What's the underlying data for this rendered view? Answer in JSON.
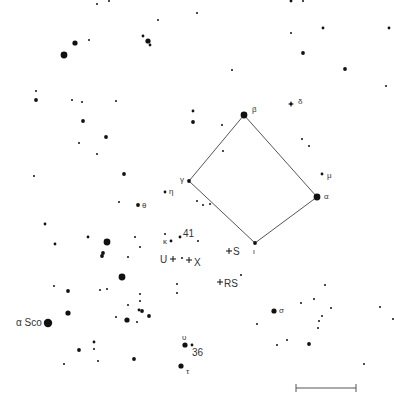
{
  "colors": {
    "background": "#ffffff",
    "star": "#111111",
    "line": "#555555",
    "label": "#333333"
  },
  "asterism": {
    "name": "Square",
    "vertices": [
      "beta",
      "alpha",
      "iota",
      "gamma"
    ],
    "note": "connecting lines beta–alpha–iota–gamma–beta"
  },
  "scale_bar": {
    "label": ""
  },
  "stars": [
    {
      "id": "beta",
      "x": 244,
      "y": 115,
      "mag": 2,
      "label": "β",
      "lx": 252,
      "ly": 112
    },
    {
      "id": "alpha",
      "x": 317,
      "y": 197,
      "mag": 2,
      "label": "α",
      "lx": 324,
      "ly": 199
    },
    {
      "id": "iota",
      "x": 255,
      "y": 243,
      "mag": 4,
      "label": "ι",
      "lx": 253,
      "ly": 254
    },
    {
      "id": "gamma",
      "x": 189,
      "y": 181,
      "mag": 4,
      "label": "γ",
      "lx": 180,
      "ly": 182
    },
    {
      "id": "delta",
      "x": 291,
      "y": 104,
      "mag": 5,
      "label": "δ",
      "lx": 298,
      "ly": 104,
      "cross": true
    },
    {
      "id": "mu",
      "x": 322,
      "y": 174,
      "mag": 5,
      "label": "μ",
      "lx": 327,
      "ly": 178
    },
    {
      "id": "eta",
      "x": 165,
      "y": 192,
      "mag": 5,
      "label": "η",
      "lx": 169,
      "ly": 194
    },
    {
      "id": "theta",
      "x": 138,
      "y": 205,
      "mag": 4,
      "label": "θ",
      "lx": 142,
      "ly": 208
    },
    {
      "id": "kappa",
      "x": 171,
      "y": 241,
      "mag": 5,
      "label": "κ",
      "lx": 163,
      "ly": 244
    },
    {
      "id": "41",
      "x": 180,
      "y": 237,
      "mag": 5,
      "label": "41",
      "lx": 183,
      "ly": 237
    },
    {
      "id": "sigma",
      "x": 274,
      "y": 311,
      "mag": 3,
      "label": "σ",
      "lx": 279,
      "ly": 313
    },
    {
      "id": "upsilon",
      "x": 185,
      "y": 345,
      "mag": 3,
      "label": "υ",
      "lx": 182,
      "ly": 340
    },
    {
      "id": "36",
      "x": 192,
      "y": 345,
      "mag": 5,
      "label": "36",
      "lx": 192,
      "ly": 356
    },
    {
      "id": "tau",
      "x": 181,
      "y": 366,
      "mag": 3,
      "label": "τ",
      "lx": 186,
      "ly": 374
    },
    {
      "id": "alphaSco",
      "x": 48,
      "y": 323,
      "mag": 1,
      "label": "α Sco",
      "lx": 16,
      "ly": 326
    },
    {
      "id": "s1",
      "x": 97,
      "y": 4,
      "mag": 6
    },
    {
      "id": "s2",
      "x": 109,
      "y": 1,
      "mag": 6
    },
    {
      "id": "s3",
      "x": 197,
      "y": 13,
      "mag": 6
    },
    {
      "id": "s4",
      "x": 158,
      "y": 20,
      "mag": 6
    },
    {
      "id": "s5",
      "x": 75,
      "y": 43,
      "mag": 3
    },
    {
      "id": "s6",
      "x": 89,
      "y": 40,
      "mag": 6
    },
    {
      "id": "s7",
      "x": 64,
      "y": 55,
      "mag": 2
    },
    {
      "id": "s8",
      "x": 143,
      "y": 36,
      "mag": 5
    },
    {
      "id": "s9",
      "x": 148,
      "y": 41,
      "mag": 3
    },
    {
      "id": "s10",
      "x": 150,
      "y": 45,
      "mag": 5
    },
    {
      "id": "s11",
      "x": 291,
      "y": 1,
      "mag": 5
    },
    {
      "id": "s12",
      "x": 303,
      "y": 1,
      "mag": 6
    },
    {
      "id": "s13",
      "x": 323,
      "y": 28,
      "mag": 5
    },
    {
      "id": "s14",
      "x": 389,
      "y": 28,
      "mag": 5
    },
    {
      "id": "s15",
      "x": 291,
      "y": 33,
      "mag": 6
    },
    {
      "id": "s16",
      "x": 303,
      "y": 53,
      "mag": 4
    },
    {
      "id": "s17",
      "x": 345,
      "y": 69,
      "mag": 4
    },
    {
      "id": "s18",
      "x": 386,
      "y": 86,
      "mag": 6
    },
    {
      "id": "s19",
      "x": 232,
      "y": 70,
      "mag": 6
    },
    {
      "id": "s20",
      "x": 36,
      "y": 91,
      "mag": 6
    },
    {
      "id": "s21",
      "x": 36,
      "y": 100,
      "mag": 4
    },
    {
      "id": "s22",
      "x": 72,
      "y": 100,
      "mag": 6
    },
    {
      "id": "s23",
      "x": 82,
      "y": 102,
      "mag": 6
    },
    {
      "id": "s24",
      "x": 116,
      "y": 101,
      "mag": 6
    },
    {
      "id": "s25",
      "x": 83,
      "y": 121,
      "mag": 4
    },
    {
      "id": "s26",
      "x": 106,
      "y": 137,
      "mag": 4
    },
    {
      "id": "s27",
      "x": 79,
      "y": 143,
      "mag": 6
    },
    {
      "id": "s28",
      "x": 97,
      "y": 154,
      "mag": 6
    },
    {
      "id": "s29",
      "x": 34,
      "y": 176,
      "mag": 6
    },
    {
      "id": "s30",
      "x": 124,
      "y": 174,
      "mag": 4
    },
    {
      "id": "s31",
      "x": 193,
      "y": 111,
      "mag": 5
    },
    {
      "id": "s32",
      "x": 193,
      "y": 122,
      "mag": 4
    },
    {
      "id": "s33",
      "x": 222,
      "y": 125,
      "mag": 6
    },
    {
      "id": "s34",
      "x": 223,
      "y": 151,
      "mag": 6
    },
    {
      "id": "s35",
      "x": 302,
      "y": 139,
      "mag": 6
    },
    {
      "id": "s36",
      "x": 309,
      "y": 146,
      "mag": 6
    },
    {
      "id": "s37",
      "x": 119,
      "y": 202,
      "mag": 6
    },
    {
      "id": "s38",
      "x": 197,
      "y": 201,
      "mag": 6
    },
    {
      "id": "s39",
      "x": 203,
      "y": 205,
      "mag": 6
    },
    {
      "id": "s40",
      "x": 210,
      "y": 204,
      "mag": 6
    },
    {
      "id": "s41",
      "x": 45,
      "y": 224,
      "mag": 5
    },
    {
      "id": "s42",
      "x": 88,
      "y": 237,
      "mag": 5
    },
    {
      "id": "s43",
      "x": 107,
      "y": 242,
      "mag": 2
    },
    {
      "id": "s44",
      "x": 55,
      "y": 244,
      "mag": 5
    },
    {
      "id": "s45",
      "x": 135,
      "y": 237,
      "mag": 6
    },
    {
      "id": "s46",
      "x": 140,
      "y": 247,
      "mag": 6
    },
    {
      "id": "s47",
      "x": 198,
      "y": 241,
      "mag": 6
    },
    {
      "id": "s48",
      "x": 103,
      "y": 253,
      "mag": 4
    },
    {
      "id": "s49",
      "x": 102,
      "y": 256,
      "mag": 4
    },
    {
      "id": "s50",
      "x": 128,
      "y": 257,
      "mag": 6
    },
    {
      "id": "s51",
      "x": 182,
      "y": 258,
      "mag": 6
    },
    {
      "id": "s52",
      "x": 122,
      "y": 277,
      "mag": 2
    },
    {
      "id": "s53",
      "x": 54,
      "y": 286,
      "mag": 6
    },
    {
      "id": "s54",
      "x": 68,
      "y": 291,
      "mag": 4
    },
    {
      "id": "s55",
      "x": 100,
      "y": 290,
      "mag": 6
    },
    {
      "id": "s56",
      "x": 107,
      "y": 289,
      "mag": 6
    },
    {
      "id": "s57",
      "x": 140,
      "y": 294,
      "mag": 6
    },
    {
      "id": "s58",
      "x": 140,
      "y": 301,
      "mag": 6
    },
    {
      "id": "s59",
      "x": 177,
      "y": 284,
      "mag": 6
    },
    {
      "id": "s60",
      "x": 177,
      "y": 293,
      "mag": 6
    },
    {
      "id": "s61",
      "x": 128,
      "y": 305,
      "mag": 6
    },
    {
      "id": "s62",
      "x": 139,
      "y": 310,
      "mag": 5
    },
    {
      "id": "s63",
      "x": 142,
      "y": 311,
      "mag": 4
    },
    {
      "id": "s64",
      "x": 149,
      "y": 316,
      "mag": 4
    },
    {
      "id": "s65",
      "x": 68,
      "y": 313,
      "mag": 3
    },
    {
      "id": "s66",
      "x": 116,
      "y": 317,
      "mag": 6
    },
    {
      "id": "s67",
      "x": 127,
      "y": 320,
      "mag": 3
    },
    {
      "id": "s68",
      "x": 137,
      "y": 322,
      "mag": 6
    },
    {
      "id": "s69",
      "x": 241,
      "y": 275,
      "mag": 6
    },
    {
      "id": "s70",
      "x": 325,
      "y": 285,
      "mag": 6
    },
    {
      "id": "s71",
      "x": 314,
      "y": 299,
      "mag": 6
    },
    {
      "id": "s72",
      "x": 301,
      "y": 303,
      "mag": 6
    },
    {
      "id": "s73",
      "x": 331,
      "y": 308,
      "mag": 6
    },
    {
      "id": "s74",
      "x": 322,
      "y": 316,
      "mag": 6
    },
    {
      "id": "s75",
      "x": 319,
      "y": 321,
      "mag": 6
    },
    {
      "id": "s76",
      "x": 318,
      "y": 328,
      "mag": 6
    },
    {
      "id": "s77",
      "x": 380,
      "y": 307,
      "mag": 6
    },
    {
      "id": "s78",
      "x": 393,
      "y": 319,
      "mag": 6
    },
    {
      "id": "s79",
      "x": 257,
      "y": 324,
      "mag": 6
    },
    {
      "id": "s80",
      "x": 287,
      "y": 340,
      "mag": 6
    },
    {
      "id": "s81",
      "x": 277,
      "y": 345,
      "mag": 6
    },
    {
      "id": "s82",
      "x": 309,
      "y": 344,
      "mag": 4
    },
    {
      "id": "s83",
      "x": 364,
      "y": 364,
      "mag": 6
    },
    {
      "id": "s84",
      "x": 94,
      "y": 342,
      "mag": 5
    },
    {
      "id": "s85",
      "x": 94,
      "y": 349,
      "mag": 6
    },
    {
      "id": "s86",
      "x": 79,
      "y": 350,
      "mag": 4
    },
    {
      "id": "s87",
      "x": 98,
      "y": 361,
      "mag": 6
    },
    {
      "id": "s88",
      "x": 64,
      "y": 364,
      "mag": 6
    },
    {
      "id": "s89",
      "x": 134,
      "y": 359,
      "mag": 4
    },
    {
      "id": "s90",
      "x": 165,
      "y": 234,
      "mag": 6
    }
  ],
  "variables": [
    {
      "id": "U",
      "x": 173,
      "y": 259,
      "label": "U",
      "lx": 160,
      "ly": 263
    },
    {
      "id": "X",
      "x": 189,
      "y": 260,
      "label": "X",
      "lx": 194,
      "ly": 266
    },
    {
      "id": "S",
      "x": 229,
      "y": 251,
      "label": "S",
      "lx": 233,
      "ly": 255
    },
    {
      "id": "RS",
      "x": 220,
      "y": 282,
      "label": "RS",
      "lx": 224,
      "ly": 287
    }
  ]
}
